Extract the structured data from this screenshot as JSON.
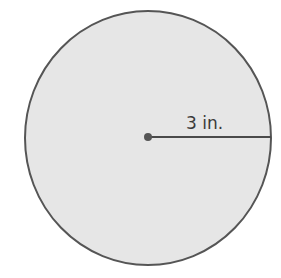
{
  "figure": {
    "shape": "circle",
    "radius_label": "3 in.",
    "colors": {
      "fill": "#e6e6e6",
      "stroke": "#555555",
      "radius_line": "#4a4a4a",
      "center_dot": "#555555",
      "label": "#3a3a3a"
    }
  }
}
